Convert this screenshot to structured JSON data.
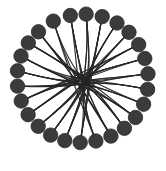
{
  "figure": {
    "background_color": "#ffffff",
    "width": 166,
    "height": 171
  },
  "chart_data": {
    "type": "scatter",
    "layout": "circular-node-link-diagram",
    "title": "",
    "subtitle": "",
    "xlabel": "",
    "ylabel": "",
    "grid": false,
    "legend": null,
    "axis_visible": false,
    "tick_labels": [],
    "annotations": [],
    "style": {
      "node_fill": "#3b3b3b",
      "node_stroke": "#2a2a2a",
      "node_stroke_width": 0.8,
      "node_radius": 7.2,
      "edge_color": "#262626",
      "edge_width": 1.15,
      "edge_opacity": 0.95,
      "background": "#ffffff"
    },
    "center": {
      "x": 84,
      "y": 82
    },
    "ring_radius_x": 66,
    "ring_radius_y": 68,
    "node_count": 26,
    "edge_count": 52,
    "hub_jitter_radius": 14,
    "nodes": [
      {
        "id": 0,
        "label": "n0",
        "angle_deg": 258,
        "x": 70.3,
        "y": 15.5
      },
      {
        "id": 1,
        "label": "n1",
        "angle_deg": 272,
        "x": 86.1,
        "y": 14.1
      },
      {
        "id": 2,
        "label": "n2",
        "angle_deg": 286,
        "x": 102.2,
        "y": 16.6
      },
      {
        "id": 3,
        "label": "n3",
        "angle_deg": 300,
        "x": 117.0,
        "y": 23.0
      },
      {
        "id": 4,
        "label": "n4",
        "angle_deg": 313,
        "x": 129.0,
        "y": 32.3
      },
      {
        "id": 5,
        "label": "n5",
        "angle_deg": 326,
        "x": 138.7,
        "y": 44.6
      },
      {
        "id": 6,
        "label": "n6",
        "angle_deg": 338,
        "x": 144.8,
        "y": 58.5
      },
      {
        "id": 7,
        "label": "n7",
        "angle_deg": 350,
        "x": 148.0,
        "y": 73.8
      },
      {
        "id": 8,
        "label": "n8",
        "angle_deg": 2,
        "x": 147.6,
        "y": 89.4
      },
      {
        "id": 9,
        "label": "n9",
        "angle_deg": 14,
        "x": 143.6,
        "y": 104.2
      },
      {
        "id": 10,
        "label": "n10",
        "angle_deg": 27,
        "x": 135.5,
        "y": 117.5
      },
      {
        "id": 11,
        "label": "n11",
        "angle_deg": 40,
        "x": 124.4,
        "y": 128.3
      },
      {
        "id": 12,
        "label": "n12",
        "angle_deg": 53,
        "x": 110.9,
        "y": 136.1
      },
      {
        "id": 13,
        "label": "n13",
        "angle_deg": 66,
        "x": 95.9,
        "y": 141.0
      },
      {
        "id": 14,
        "label": "n14",
        "angle_deg": 79,
        "x": 80.2,
        "y": 142.6
      },
      {
        "id": 15,
        "label": "n15",
        "angle_deg": 92,
        "x": 64.8,
        "y": 140.6
      },
      {
        "id": 16,
        "label": "n16",
        "angle_deg": 105,
        "x": 50.6,
        "y": 135.1
      },
      {
        "id": 17,
        "label": "n17",
        "angle_deg": 118,
        "x": 38.2,
        "y": 126.3
      },
      {
        "id": 18,
        "label": "n18",
        "angle_deg": 131,
        "x": 28.1,
        "y": 114.7
      },
      {
        "id": 19,
        "label": "n19",
        "angle_deg": 144,
        "x": 21.2,
        "y": 101.0
      },
      {
        "id": 20,
        "label": "n20",
        "angle_deg": 157,
        "x": 17.5,
        "y": 86.1
      },
      {
        "id": 21,
        "label": "n21",
        "angle_deg": 170,
        "x": 17.5,
        "y": 70.8
      },
      {
        "id": 22,
        "label": "n22",
        "angle_deg": 183,
        "x": 21.0,
        "y": 56.0
      },
      {
        "id": 23,
        "label": "n23",
        "angle_deg": 196,
        "x": 28.3,
        "y": 42.9
      },
      {
        "id": 24,
        "label": "n24",
        "angle_deg": 210,
        "x": 38.5,
        "y": 31.8
      },
      {
        "id": 25,
        "label": "n25",
        "angle_deg": 232,
        "x": 53.3,
        "y": 21.1
      }
    ],
    "edges": [
      {
        "source": 0,
        "target": 13
      },
      {
        "source": 0,
        "target": 14
      },
      {
        "source": 1,
        "target": 14
      },
      {
        "source": 1,
        "target": 15
      },
      {
        "source": 2,
        "target": 15
      },
      {
        "source": 2,
        "target": 16
      },
      {
        "source": 3,
        "target": 16
      },
      {
        "source": 3,
        "target": 17
      },
      {
        "source": 4,
        "target": 17
      },
      {
        "source": 4,
        "target": 18
      },
      {
        "source": 5,
        "target": 18
      },
      {
        "source": 5,
        "target": 19
      },
      {
        "source": 6,
        "target": 19
      },
      {
        "source": 6,
        "target": 20
      },
      {
        "source": 7,
        "target": 20
      },
      {
        "source": 7,
        "target": 21
      },
      {
        "source": 8,
        "target": 21
      },
      {
        "source": 8,
        "target": 22
      },
      {
        "source": 9,
        "target": 22
      },
      {
        "source": 9,
        "target": 23
      },
      {
        "source": 10,
        "target": 23
      },
      {
        "source": 10,
        "target": 24
      },
      {
        "source": 11,
        "target": 24
      },
      {
        "source": 11,
        "target": 25
      },
      {
        "source": 12,
        "target": 25
      },
      {
        "source": 12,
        "target": 0
      },
      {
        "source": 13,
        "target": 1
      },
      {
        "source": 14,
        "target": 2
      },
      {
        "source": 15,
        "target": 3
      },
      {
        "source": 16,
        "target": 4
      },
      {
        "source": 17,
        "target": 5
      },
      {
        "source": 18,
        "target": 6
      },
      {
        "source": 19,
        "target": 7
      },
      {
        "source": 20,
        "target": 8
      },
      {
        "source": 21,
        "target": 9
      },
      {
        "source": 22,
        "target": 10
      },
      {
        "source": 23,
        "target": 11
      },
      {
        "source": 24,
        "target": 12
      },
      {
        "source": 25,
        "target": 13
      },
      {
        "source": 0,
        "target": 12
      },
      {
        "source": 1,
        "target": 13
      },
      {
        "source": 2,
        "target": 14
      },
      {
        "source": 3,
        "target": 15
      },
      {
        "source": 4,
        "target": 16
      },
      {
        "source": 5,
        "target": 17
      },
      {
        "source": 6,
        "target": 18
      },
      {
        "source": 7,
        "target": 19
      },
      {
        "source": 8,
        "target": 20
      },
      {
        "source": 9,
        "target": 21
      },
      {
        "source": 10,
        "target": 22
      },
      {
        "source": 11,
        "target": 23
      },
      {
        "source": 12,
        "target": 24
      }
    ]
  }
}
